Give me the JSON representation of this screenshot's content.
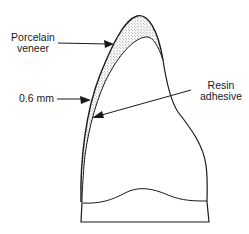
{
  "diagram": {
    "labels": {
      "porcelain_veneer_line1": "Porcelain",
      "porcelain_veneer_line2": "veneer",
      "thickness": "0.6 mm",
      "resin_adhesive_line1": "Resin",
      "resin_adhesive_line2": "adhesive"
    },
    "colors": {
      "stroke": "#1a1a1a",
      "stipple": "#555555",
      "background": "#ffffff"
    }
  }
}
